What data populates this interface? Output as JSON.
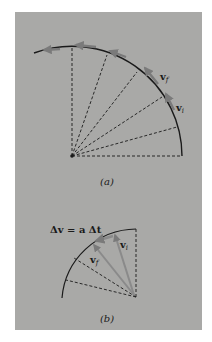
{
  "figure": {
    "background_color": "#a9a9a7",
    "line_color": "#1a1a1a",
    "arrow_color": "#7a7a7a",
    "part_a": {
      "caption": "(a)",
      "label_vf": "v",
      "label_vf_sub": "f",
      "label_vi": "v",
      "label_vi_sub": "i"
    },
    "part_b": {
      "caption": "(b)",
      "equation": "Δv = a Δt",
      "label_vf": "v",
      "label_vf_sub": "f",
      "label_vi": "v",
      "label_vi_sub": "i"
    }
  }
}
